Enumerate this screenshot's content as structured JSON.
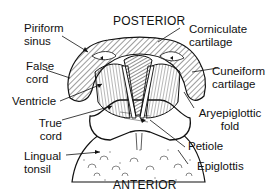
{
  "diagram": {
    "orientation": {
      "top": "POSTERIOR",
      "bottom": "ANTERIOR"
    },
    "labels": [
      {
        "id": "piriform-sinus",
        "line1": "Piriform",
        "line2": "sinus",
        "side": "left"
      },
      {
        "id": "false-cord",
        "line1": "False",
        "line2": "cord",
        "side": "left"
      },
      {
        "id": "ventricle",
        "line1": "Ventricle",
        "line2": "",
        "side": "left"
      },
      {
        "id": "true-cord",
        "line1": "True",
        "line2": "cord",
        "side": "left"
      },
      {
        "id": "lingual-tonsil",
        "line1": "Lingual",
        "line2": "tonsil",
        "side": "left"
      },
      {
        "id": "corniculate-cartilage",
        "line1": "Corniculate",
        "line2": "cartilage",
        "side": "right"
      },
      {
        "id": "cuneiform-cartilage",
        "line1": "Cuneiform",
        "line2": "cartilage",
        "side": "right"
      },
      {
        "id": "aryepiglottic-fold",
        "line1": "Aryepiglottic",
        "line2": "fold",
        "side": "right"
      },
      {
        "id": "petiole",
        "line1": "Petiole",
        "line2": "",
        "side": "right"
      },
      {
        "id": "epiglottis",
        "line1": "Epiglottis",
        "line2": "",
        "side": "right"
      }
    ]
  }
}
